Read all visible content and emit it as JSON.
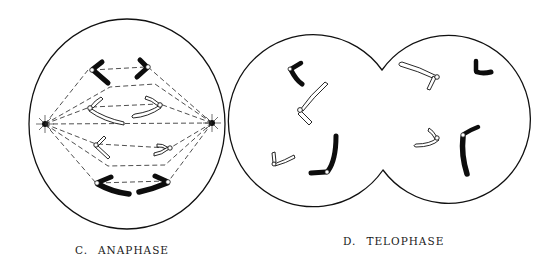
{
  "panels": [
    {
      "id": "C",
      "letter": "C.",
      "title": "ANAPHASE",
      "description": "Single round cell with two spindle poles; chromatid pairs separating toward opposite poles along dashed spindle fibers"
    },
    {
      "id": "D",
      "letter": "D.",
      "title": "TELOPHASE",
      "description": "Cell pinching into two daughter cells (cleavage furrow), each containing a set of chromosomes"
    }
  ],
  "colors": {
    "outline": "#111111",
    "chromosome_dark": "#0d0d0d",
    "chromosome_light": "#ffffff",
    "background": "#ffffff"
  }
}
